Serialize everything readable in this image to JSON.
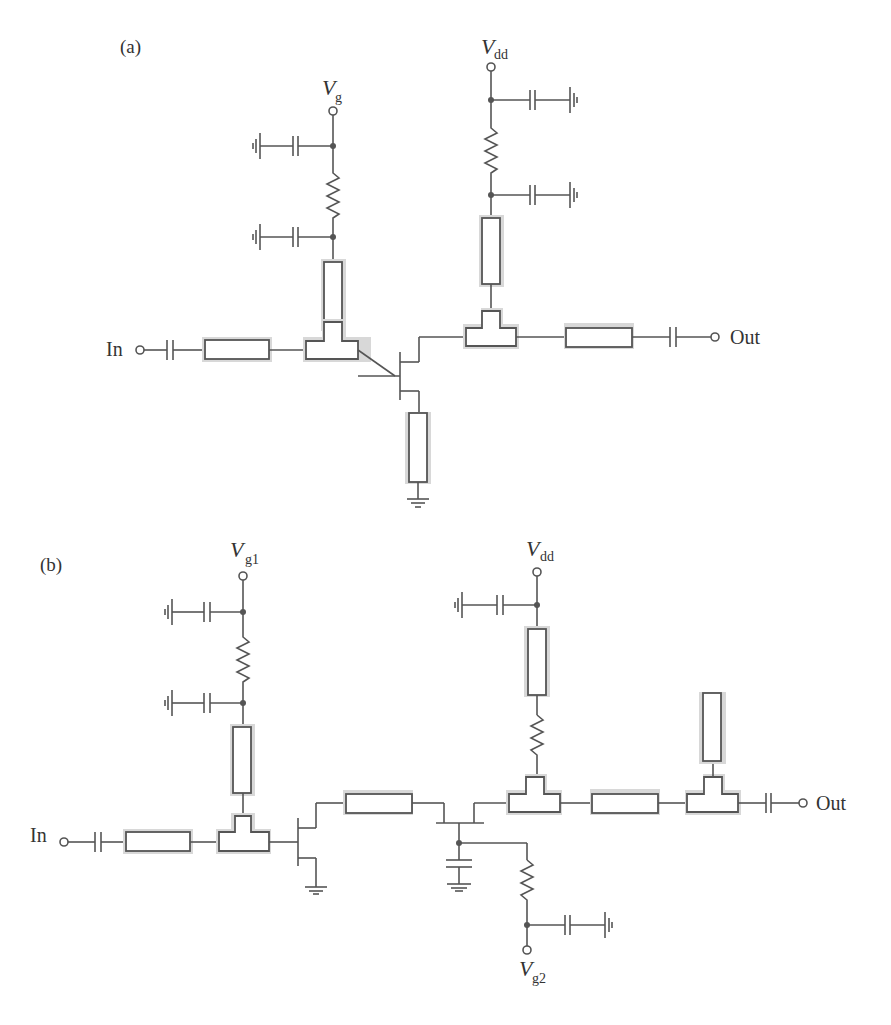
{
  "figure": {
    "panel_a": {
      "label": "(a)",
      "terminals": {
        "gate_bias": {
          "symbol": "V",
          "subscript": "g"
        },
        "drain_bias": {
          "symbol": "V",
          "subscript": "dd"
        },
        "input": "In",
        "output": "Out"
      },
      "description": "Single-stage FET amplifier with gate and drain bias networks, microstrip T-junction matching, source feedback line to ground"
    },
    "panel_b": {
      "label": "(b)",
      "terminals": {
        "gate1_bias": {
          "symbol": "V",
          "subscript": "g1"
        },
        "gate2_bias": {
          "symbol": "V",
          "subscript": "g2"
        },
        "drain_bias": {
          "symbol": "V",
          "subscript": "dd"
        },
        "input": "In",
        "output": "Out"
      },
      "description": "Cascode (two-FET) amplifier with gate1, gate2 and drain bias networks, interstage line, output open stub"
    }
  },
  "colors": {
    "wire": "#555555",
    "line_shadow": "#d8d8d8",
    "text": "#333333",
    "background": "#ffffff"
  }
}
